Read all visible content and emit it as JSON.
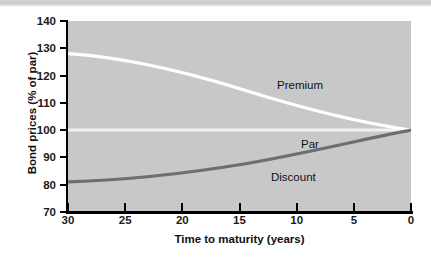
{
  "figure": {
    "y_axis_title": "Bond prices (% of par)",
    "x_axis_title": "Time to maturity (years)",
    "plot_background_color": "#c8c8c8",
    "page_background_color": "#ffffff"
  },
  "annotations": {
    "premium": "Premium",
    "par": "Par",
    "discount": "Discount"
  },
  "axes": {
    "y_ticks": [
      "140",
      "130",
      "120",
      "110",
      "100",
      "90",
      "80",
      "70"
    ],
    "x_ticks": [
      "30",
      "25",
      "20",
      "15",
      "10",
      "5",
      "0"
    ]
  },
  "chart_data": {
    "type": "line",
    "title": "",
    "subtitle": "",
    "xlabel": "Time to maturity (years)",
    "ylabel": "Bond prices (% of par)",
    "xlim": [
      30,
      0
    ],
    "ylim": [
      70,
      140
    ],
    "x_reversed": true,
    "grid": false,
    "legend": "inline-annotations",
    "x_tick_values": [
      30,
      25,
      20,
      15,
      10,
      5,
      0
    ],
    "y_tick_values": [
      70,
      80,
      90,
      100,
      110,
      120,
      130,
      140
    ],
    "x": [
      30,
      25,
      20,
      15,
      10,
      5,
      0
    ],
    "series": [
      {
        "name": "Premium",
        "color": "#ffffff",
        "label_text": "Premium",
        "values": [
          128.0,
          126.5,
          123.5,
          119.0,
          113.5,
          107.0,
          100.0
        ]
      },
      {
        "name": "Par",
        "color": "#f2f2f2",
        "label_text": "Par",
        "values": [
          100,
          100,
          100,
          100,
          100,
          100,
          100
        ]
      },
      {
        "name": "Discount",
        "color": "#6e6e6e",
        "label_text": "Discount",
        "values": [
          81.0,
          81.5,
          83.0,
          86.0,
          89.5,
          94.5,
          100.0
        ]
      }
    ],
    "annotations": [
      {
        "text": "Premium",
        "x": 14.5,
        "y": 124
      },
      {
        "text": "Par",
        "x": 11.0,
        "y": 104
      },
      {
        "text": "Discount",
        "x": 14.5,
        "y": 92
      }
    ]
  }
}
